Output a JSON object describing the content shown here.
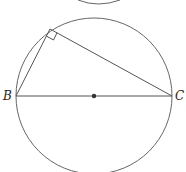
{
  "diagram": {
    "labels": {
      "B": "B",
      "C": "C"
    },
    "circle": {
      "cx": 94,
      "cy": 96,
      "r": 78
    },
    "points": {
      "A": [
        50,
        29
      ],
      "B": [
        16,
        96
      ],
      "C": [
        172,
        96
      ],
      "O": [
        94,
        96
      ]
    },
    "right_angle_at": "A",
    "stroke_color": "#555555",
    "top_arc_fragment": true
  }
}
